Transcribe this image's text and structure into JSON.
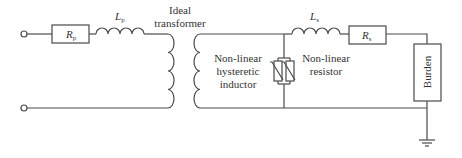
{
  "diagram": {
    "colors": {
      "line": "#4a4a4a",
      "text": "#333333",
      "background": "#ffffff"
    },
    "components": {
      "primary_resistor": {
        "symbol": "R",
        "sub": "p"
      },
      "primary_inductor": {
        "symbol": "L",
        "sub": "p"
      },
      "transformer": {
        "line1": "Ideal",
        "line2": "transformer"
      },
      "hysteretic_inductor": {
        "line1": "Non-linear",
        "line2": "hysteretic",
        "line3": "inductor"
      },
      "nonlinear_resistor": {
        "line1": "Non-linear",
        "line2": "resistor"
      },
      "secondary_inductor": {
        "symbol": "L",
        "sub": "s"
      },
      "secondary_resistor": {
        "symbol": "R",
        "sub": "s"
      },
      "burden": {
        "label": "Burden"
      }
    },
    "terminals": [
      "input-top-terminal",
      "input-bottom-terminal"
    ],
    "ground": "ground-symbol"
  }
}
